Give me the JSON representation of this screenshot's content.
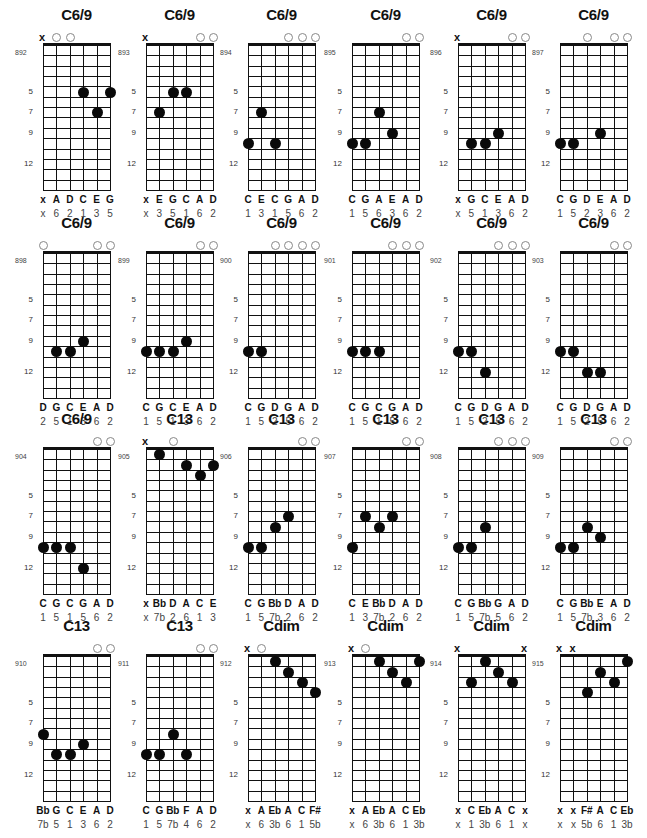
{
  "page": {
    "layout": {
      "cols": 6,
      "rows": 4,
      "col_x": [
        43,
        146,
        248,
        352,
        458,
        560
      ],
      "row_y": [
        45,
        253,
        449,
        656
      ],
      "string_gap": 13.4,
      "fret_h": 10.35,
      "frets": 14
    },
    "fret_markers": [
      "5",
      "7",
      "9",
      "12"
    ]
  },
  "chords": [
    {
      "id": "892",
      "name": "C6/9",
      "strings": [
        "x",
        "open",
        "open",
        "",
        "",
        ""
      ],
      "dots": [
        [
          4,
          5
        ],
        [
          5,
          7
        ],
        [
          6,
          5
        ]
      ],
      "notes": [
        "x",
        "A",
        "D",
        "C",
        "E",
        "G"
      ],
      "degrees": [
        "x",
        "6",
        "2",
        "1",
        "3",
        "5"
      ]
    },
    {
      "id": "893",
      "name": "C6/9",
      "strings": [
        "x",
        "",
        "",
        "",
        "open",
        "open"
      ],
      "dots": [
        [
          2,
          7
        ],
        [
          3,
          5
        ],
        [
          4,
          5
        ]
      ],
      "notes": [
        "x",
        "E",
        "G",
        "C",
        "A",
        "D"
      ],
      "degrees": [
        "x",
        "3",
        "5",
        "1",
        "6",
        "2"
      ]
    },
    {
      "id": "894",
      "name": "C6/9",
      "strings": [
        "",
        "",
        "",
        "open",
        "open",
        "open"
      ],
      "dots": [
        [
          1,
          10
        ],
        [
          2,
          7
        ],
        [
          3,
          10
        ]
      ],
      "notes": [
        "C",
        "E",
        "C",
        "G",
        "A",
        "D"
      ],
      "degrees": [
        "1",
        "3",
        "1",
        "5",
        "6",
        "2"
      ]
    },
    {
      "id": "895",
      "name": "C6/9",
      "strings": [
        "",
        "",
        "",
        "",
        "open",
        "open"
      ],
      "dots": [
        [
          1,
          10
        ],
        [
          2,
          10
        ],
        [
          3,
          7
        ],
        [
          4,
          9
        ]
      ],
      "notes": [
        "C",
        "G",
        "A",
        "E",
        "A",
        "D"
      ],
      "degrees": [
        "1",
        "5",
        "6",
        "3",
        "6",
        "2"
      ]
    },
    {
      "id": "896",
      "name": "C6/9",
      "strings": [
        "x",
        "",
        "",
        "",
        "open",
        "open"
      ],
      "dots": [
        [
          2,
          10
        ],
        [
          3,
          10
        ],
        [
          4,
          9
        ]
      ],
      "notes": [
        "x",
        "G",
        "C",
        "E",
        "A",
        "D"
      ],
      "degrees": [
        "x",
        "5",
        "1",
        "3",
        "6",
        "2"
      ]
    },
    {
      "id": "897",
      "name": "C6/9",
      "strings": [
        "",
        "",
        "open",
        "",
        "open",
        "open"
      ],
      "dots": [
        [
          1,
          10
        ],
        [
          2,
          10
        ],
        [
          4,
          9
        ]
      ],
      "notes": [
        "C",
        "G",
        "D",
        "E",
        "A",
        "D"
      ],
      "degrees": [
        "1",
        "5",
        "2",
        "3",
        "6",
        "2"
      ]
    },
    {
      "id": "898",
      "name": "C6/9",
      "strings": [
        "open",
        "",
        "",
        "",
        "open",
        "open"
      ],
      "dots": [
        [
          2,
          10
        ],
        [
          3,
          10
        ],
        [
          4,
          9
        ]
      ],
      "notes": [
        "D",
        "G",
        "C",
        "E",
        "A",
        "D"
      ],
      "degrees": [
        "2",
        "5",
        "1",
        "3",
        "6",
        "2"
      ]
    },
    {
      "id": "899",
      "name": "C6/9",
      "strings": [
        "",
        "",
        "",
        "",
        "open",
        "open"
      ],
      "dots": [
        [
          1,
          10
        ],
        [
          2,
          10
        ],
        [
          3,
          10
        ],
        [
          4,
          9
        ]
      ],
      "notes": [
        "C",
        "G",
        "C",
        "E",
        "A",
        "D"
      ],
      "degrees": [
        "1",
        "5",
        "1",
        "3",
        "6",
        "2"
      ]
    },
    {
      "id": "900",
      "name": "C6/9",
      "strings": [
        "",
        "",
        "open",
        "open",
        "open",
        "open"
      ],
      "dots": [
        [
          1,
          10
        ],
        [
          2,
          10
        ]
      ],
      "notes": [
        "C",
        "G",
        "D",
        "G",
        "A",
        "D"
      ],
      "degrees": [
        "1",
        "5",
        "2",
        "5",
        "6",
        "2"
      ]
    },
    {
      "id": "901",
      "name": "C6/9",
      "strings": [
        "",
        "",
        "",
        "open",
        "open",
        "open"
      ],
      "dots": [
        [
          1,
          10
        ],
        [
          2,
          10
        ],
        [
          3,
          10
        ]
      ],
      "notes": [
        "C",
        "G",
        "C",
        "G",
        "A",
        "D"
      ],
      "degrees": [
        "1",
        "5",
        "1",
        "5",
        "6",
        "2"
      ]
    },
    {
      "id": "902",
      "name": "C6/9",
      "strings": [
        "",
        "",
        "",
        "open",
        "open",
        "open"
      ],
      "dots": [
        [
          1,
          10
        ],
        [
          2,
          10
        ],
        [
          3,
          12
        ]
      ],
      "notes": [
        "C",
        "G",
        "D",
        "G",
        "A",
        "D"
      ],
      "degrees": [
        "1",
        "5",
        "2",
        "5",
        "6",
        "2"
      ]
    },
    {
      "id": "903",
      "name": "C6/9",
      "strings": [
        "",
        "",
        "",
        "",
        "open",
        "open"
      ],
      "dots": [
        [
          1,
          10
        ],
        [
          2,
          10
        ],
        [
          3,
          12
        ],
        [
          4,
          12
        ]
      ],
      "notes": [
        "C",
        "G",
        "D",
        "G",
        "A",
        "D"
      ],
      "degrees": [
        "1",
        "5",
        "2",
        "5",
        "6",
        "2"
      ]
    },
    {
      "id": "904",
      "name": "C6/9",
      "strings": [
        "",
        "",
        "",
        "",
        "open",
        "open"
      ],
      "dots": [
        [
          1,
          10
        ],
        [
          2,
          10
        ],
        [
          3,
          10
        ],
        [
          4,
          12
        ]
      ],
      "notes": [
        "C",
        "G",
        "C",
        "G",
        "A",
        "D"
      ],
      "degrees": [
        "1",
        "5",
        "1",
        "5",
        "6",
        "2"
      ]
    },
    {
      "id": "905",
      "name": "C13",
      "strings": [
        "x",
        "",
        "open",
        "",
        "",
        ""
      ],
      "dots": [
        [
          2,
          1
        ],
        [
          4,
          2
        ],
        [
          5,
          3
        ],
        [
          6,
          2
        ]
      ],
      "notes": [
        "x",
        "Bb",
        "D",
        "A",
        "C",
        "E"
      ],
      "degrees": [
        "x",
        "7b",
        "2",
        "6",
        "1",
        "3"
      ]
    },
    {
      "id": "906",
      "name": "C13",
      "strings": [
        "",
        "",
        "",
        "",
        "open",
        "open"
      ],
      "dots": [
        [
          1,
          10
        ],
        [
          2,
          10
        ],
        [
          3,
          8
        ],
        [
          4,
          7
        ]
      ],
      "notes": [
        "C",
        "G",
        "Bb",
        "D",
        "A",
        "D"
      ],
      "degrees": [
        "1",
        "5",
        "7b",
        "2",
        "6",
        "2"
      ]
    },
    {
      "id": "907",
      "name": "C13",
      "strings": [
        "",
        "",
        "",
        "",
        "open",
        "open"
      ],
      "dots": [
        [
          1,
          10
        ],
        [
          2,
          7
        ],
        [
          3,
          8
        ],
        [
          4,
          7
        ]
      ],
      "notes": [
        "C",
        "E",
        "Bb",
        "D",
        "A",
        "D"
      ],
      "degrees": [
        "1",
        "3",
        "7b",
        "2",
        "6",
        "2"
      ]
    },
    {
      "id": "908",
      "name": "C13",
      "strings": [
        "",
        "",
        "",
        "open",
        "open",
        "open"
      ],
      "dots": [
        [
          1,
          10
        ],
        [
          2,
          10
        ],
        [
          3,
          8
        ]
      ],
      "notes": [
        "C",
        "G",
        "Bb",
        "G",
        "A",
        "D"
      ],
      "degrees": [
        "1",
        "5",
        "7b",
        "5",
        "6",
        "2"
      ]
    },
    {
      "id": "909",
      "name": "C13",
      "strings": [
        "",
        "",
        "",
        "",
        "open",
        "open"
      ],
      "dots": [
        [
          1,
          10
        ],
        [
          2,
          10
        ],
        [
          3,
          8
        ],
        [
          4,
          9
        ]
      ],
      "notes": [
        "C",
        "G",
        "Bb",
        "E",
        "A",
        "D"
      ],
      "degrees": [
        "1",
        "5",
        "7b",
        "3",
        "6",
        "2"
      ]
    },
    {
      "id": "910",
      "name": "C13",
      "strings": [
        "",
        "",
        "",
        "",
        "open",
        "open"
      ],
      "dots": [
        [
          1,
          8
        ],
        [
          2,
          10
        ],
        [
          3,
          10
        ],
        [
          4,
          9
        ]
      ],
      "notes": [
        "Bb",
        "G",
        "C",
        "E",
        "A",
        "D"
      ],
      "degrees": [
        "7b",
        "5",
        "1",
        "3",
        "6",
        "2"
      ]
    },
    {
      "id": "911",
      "name": "C13",
      "strings": [
        "",
        "",
        "",
        "",
        "open",
        "open"
      ],
      "dots": [
        [
          1,
          10
        ],
        [
          2,
          10
        ],
        [
          3,
          8
        ],
        [
          4,
          10
        ]
      ],
      "notes": [
        "C",
        "G",
        "Bb",
        "F",
        "A",
        "D"
      ],
      "degrees": [
        "1",
        "5",
        "7b",
        "4",
        "6",
        "2"
      ]
    },
    {
      "id": "912",
      "name": "Cdim",
      "strings": [
        "x",
        "open",
        "",
        "",
        "",
        ""
      ],
      "dots": [
        [
          3,
          1
        ],
        [
          4,
          2
        ],
        [
          5,
          3
        ],
        [
          6,
          4
        ]
      ],
      "notes": [
        "x",
        "A",
        "Eb",
        "A",
        "C",
        "F#"
      ],
      "degrees": [
        "x",
        "6",
        "3b",
        "6",
        "1",
        "5b"
      ]
    },
    {
      "id": "913",
      "name": "Cdim",
      "strings": [
        "x",
        "open",
        "",
        "",
        "",
        ""
      ],
      "dots": [
        [
          3,
          1
        ],
        [
          4,
          2
        ],
        [
          5,
          3
        ],
        [
          6,
          1
        ]
      ],
      "notes": [
        "x",
        "A",
        "Eb",
        "A",
        "C",
        "Eb"
      ],
      "degrees": [
        "x",
        "6",
        "3b",
        "6",
        "1",
        "3b"
      ]
    },
    {
      "id": "914",
      "name": "Cdim",
      "strings": [
        "x",
        "",
        "",
        "",
        "",
        "x"
      ],
      "dots": [
        [
          2,
          3
        ],
        [
          3,
          1
        ],
        [
          4,
          2
        ],
        [
          5,
          3
        ]
      ],
      "notes": [
        "x",
        "C",
        "Eb",
        "A",
        "C",
        "x"
      ],
      "degrees": [
        "x",
        "1",
        "3b",
        "6",
        "1",
        "x"
      ]
    },
    {
      "id": "915",
      "name": "Cdim",
      "strings": [
        "x",
        "x",
        "",
        "",
        "",
        ""
      ],
      "dots": [
        [
          3,
          4
        ],
        [
          4,
          2
        ],
        [
          5,
          3
        ],
        [
          6,
          1
        ]
      ],
      "notes": [
        "x",
        "x",
        "F#",
        "A",
        "C",
        "Eb"
      ],
      "degrees": [
        "x",
        "x",
        "5b",
        "6",
        "1",
        "3b"
      ]
    }
  ]
}
